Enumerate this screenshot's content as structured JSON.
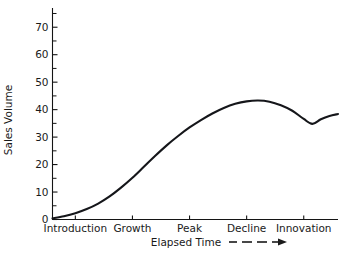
{
  "chart_data": {
    "type": "line",
    "title": "",
    "xlabel": "Elapsed Time",
    "ylabel": "Sales Volume",
    "categories": [
      "Introduction",
      "Growth",
      "Peak",
      "Decline",
      "Innovation"
    ],
    "y_tick_labels": [
      "0",
      "10",
      "20",
      "30",
      "40",
      "50",
      "60",
      "70"
    ],
    "y_tick_values": [
      0,
      10,
      20,
      30,
      40,
      50,
      60,
      70
    ],
    "y_minor_tick_values": [
      5,
      15,
      25,
      35,
      45,
      55,
      65,
      75
    ],
    "ylim": [
      0,
      77
    ],
    "xlim": [
      0,
      100
    ],
    "grid": false,
    "legend": false,
    "series": [
      {
        "name": "Sales Volume",
        "x": [
          0,
          4,
          8,
          12,
          16,
          20,
          24,
          28,
          32,
          36,
          40,
          44,
          48,
          52,
          56,
          60,
          64,
          68,
          72,
          76,
          80,
          84,
          88,
          91,
          94,
          97,
          100
        ],
        "values": [
          0.4,
          1.2,
          2.3,
          3.8,
          5.8,
          8.4,
          11.6,
          15.2,
          19.2,
          23.2,
          27.0,
          30.4,
          33.5,
          36.2,
          38.6,
          40.6,
          42.1,
          43.0,
          43.3,
          42.9,
          41.6,
          39.6,
          36.6,
          34.8,
          36.5,
          37.7,
          38.4
        ]
      }
    ],
    "annotations": [
      {
        "name": "x-axis-arrow",
        "style": "dashed-arrow",
        "follows": "Elapsed Time"
      }
    ]
  },
  "axis": {
    "x_tick_label_positions": [
      8,
      28,
      48,
      68,
      88
    ]
  }
}
